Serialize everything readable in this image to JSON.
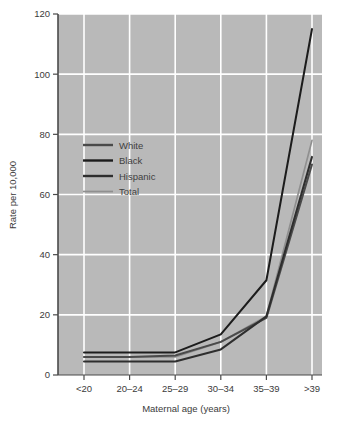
{
  "chart_data": {
    "type": "line",
    "title": "",
    "xlabel": "Maternal age (years)",
    "ylabel": "Rate per 10,000",
    "categories": [
      "<20",
      "20–24",
      "25–29",
      "30–34",
      "35–39",
      ">39"
    ],
    "ylim": [
      0,
      120
    ],
    "yticks": [
      0,
      20,
      40,
      60,
      80,
      100,
      120
    ],
    "ytick_labels": [
      "0",
      "20",
      "40",
      "60",
      "80",
      "100",
      "120"
    ],
    "grid": true,
    "grid_color": "#ffffff",
    "plot_background": "#b9b9b9",
    "figure_background": "#ffffff",
    "legend_position": "upper-left-inside",
    "series": [
      {
        "name": "White",
        "color": "#4a4a4a",
        "values": [
          6.0,
          6.0,
          6.5,
          11.0,
          19.0,
          70.0
        ]
      },
      {
        "name": "Black",
        "color": "#1c1c1c",
        "values": [
          7.5,
          7.5,
          7.5,
          13.5,
          31.5,
          115.0
        ]
      },
      {
        "name": "Hispanic",
        "color": "#2e2e2e",
        "values": [
          4.5,
          4.5,
          4.5,
          8.5,
          19.5,
          72.5
        ]
      },
      {
        "name": "Total",
        "color": "#8f8f8f",
        "values": [
          6.0,
          6.0,
          6.0,
          11.0,
          19.5,
          78.0
        ]
      }
    ]
  },
  "axes": {
    "ylabel": "Rate per 10,000",
    "xlabel": "Maternal age (years)"
  },
  "legend": {
    "items": [
      {
        "label": "White"
      },
      {
        "label": "Black"
      },
      {
        "label": "Hispanic"
      },
      {
        "label": "Total"
      }
    ]
  },
  "ticks": {
    "y": [
      "120",
      "100",
      "80",
      "60",
      "40",
      "20",
      "0"
    ],
    "x": [
      "<20",
      "20–24",
      "25–29",
      "30–34",
      "35–39",
      ">39"
    ]
  }
}
